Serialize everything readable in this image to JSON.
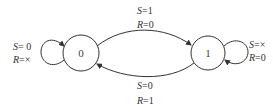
{
  "diagram": {
    "type": "state-transition-diagram",
    "states": [
      {
        "id": "0",
        "label": "0"
      },
      {
        "id": "1",
        "label": "1"
      }
    ],
    "transitions": [
      {
        "from": "0",
        "to": "1",
        "s_var": "S",
        "s_val": "1",
        "r_var": "R",
        "r_val": "0",
        "s_text": "=1",
        "r_text": "=0"
      },
      {
        "from": "1",
        "to": "0",
        "s_var": "S",
        "s_val": "0",
        "r_var": "R",
        "r_val": "1",
        "s_text": "=0",
        "r_text": "=1"
      },
      {
        "from": "0",
        "to": "0",
        "s_var": "S",
        "s_val": "0",
        "r_var": "R",
        "r_val": "×",
        "s_text": "= 0",
        "r_text": "=×"
      },
      {
        "from": "1",
        "to": "1",
        "s_var": "S",
        "s_val": "×",
        "r_var": "R",
        "r_val": "0",
        "s_text": "=×",
        "r_text": "=0"
      }
    ]
  },
  "colors": {
    "line": "#333333",
    "background": "#ffffff"
  }
}
